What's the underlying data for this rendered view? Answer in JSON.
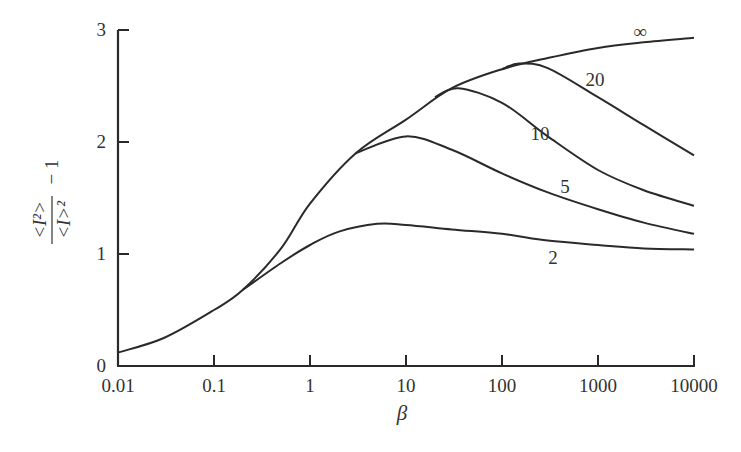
{
  "chart_data": {
    "type": "line",
    "title": "",
    "xlabel": "β",
    "ylabel": "<I²>/<I>² − 1",
    "xscale": "log",
    "xlim": [
      0.01,
      10000
    ],
    "ylim": [
      0,
      3
    ],
    "grid": false,
    "legend": "inline curve labels",
    "x_ticks": [
      "0.01",
      "0.1",
      "1",
      "10",
      "100",
      "1000",
      "10000"
    ],
    "y_ticks": [
      "0",
      "1",
      "2",
      "3"
    ],
    "series": [
      {
        "name": "∞",
        "label": "∞",
        "points": [
          [
            0.01,
            0.12
          ],
          [
            0.03,
            0.25
          ],
          [
            0.1,
            0.5
          ],
          [
            0.2,
            0.68
          ],
          [
            0.5,
            1.05
          ],
          [
            1,
            1.45
          ],
          [
            3,
            1.9
          ],
          [
            10,
            2.2
          ],
          [
            30,
            2.48
          ],
          [
            100,
            2.65
          ],
          [
            300,
            2.75
          ],
          [
            1000,
            2.84
          ],
          [
            3000,
            2.89
          ],
          [
            10000,
            2.93
          ]
        ]
      },
      {
        "name": "20",
        "label": "20",
        "points": [
          [
            100,
            2.65
          ],
          [
            150,
            2.7
          ],
          [
            300,
            2.66
          ],
          [
            1000,
            2.4
          ],
          [
            3000,
            2.15
          ],
          [
            10000,
            1.88
          ]
        ]
      },
      {
        "name": "10",
        "label": "10",
        "points": [
          [
            20,
            2.4
          ],
          [
            35,
            2.48
          ],
          [
            100,
            2.35
          ],
          [
            300,
            2.05
          ],
          [
            1000,
            1.75
          ],
          [
            3000,
            1.57
          ],
          [
            10000,
            1.43
          ]
        ]
      },
      {
        "name": "5",
        "label": "5",
        "points": [
          [
            3,
            1.9
          ],
          [
            10,
            2.05
          ],
          [
            30,
            1.93
          ],
          [
            100,
            1.72
          ],
          [
            300,
            1.55
          ],
          [
            1000,
            1.4
          ],
          [
            3000,
            1.28
          ],
          [
            10000,
            1.18
          ]
        ]
      },
      {
        "name": "2",
        "label": "2",
        "points": [
          [
            0.2,
            0.68
          ],
          [
            0.5,
            0.92
          ],
          [
            1,
            1.08
          ],
          [
            2,
            1.2
          ],
          [
            5,
            1.27
          ],
          [
            10,
            1.26
          ],
          [
            30,
            1.22
          ],
          [
            100,
            1.18
          ],
          [
            300,
            1.12
          ],
          [
            1000,
            1.08
          ],
          [
            3000,
            1.05
          ],
          [
            10000,
            1.04
          ]
        ]
      }
    ]
  },
  "labels": {
    "y_numerator": "<I²>",
    "y_denominator": "<I>²",
    "y_suffix": "− 1",
    "x_axis": "β"
  }
}
